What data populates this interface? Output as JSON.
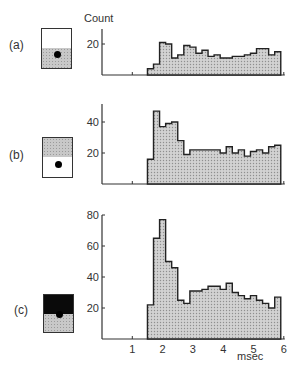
{
  "figure": {
    "y_axis_title": "Count",
    "x_axis_title": "msec",
    "panels": [
      {
        "label": "(a)",
        "inset": "lower half shaded, dot in shaded region"
      },
      {
        "label": "(b)",
        "inset": "upper half shaded, dot in unshaded lower region"
      },
      {
        "label": "(c)",
        "inset": "upper half black, lower half shaded, dot at boundary"
      }
    ]
  },
  "chart_data": [
    {
      "type": "bar",
      "panel": "(a)",
      "title": "",
      "xlabel": "msec",
      "ylabel": "Count",
      "bin_start": 1.5,
      "bin_width": 0.2,
      "x": [
        1.5,
        1.7,
        1.9,
        2.1,
        2.3,
        2.5,
        2.7,
        2.9,
        3.1,
        3.3,
        3.5,
        3.7,
        3.9,
        4.1,
        4.3,
        4.5,
        4.7,
        4.9,
        5.1,
        5.3,
        5.5,
        5.7
      ],
      "values": [
        4,
        7,
        21,
        20,
        11,
        13,
        19,
        18,
        14,
        16,
        12,
        13,
        11,
        11,
        12,
        12,
        13,
        14,
        17,
        17,
        13,
        15
      ],
      "yticks": [
        20
      ],
      "ylim": [
        0,
        30
      ],
      "xlim": [
        0,
        6
      ],
      "grid": false
    },
    {
      "type": "bar",
      "panel": "(b)",
      "title": "",
      "xlabel": "msec",
      "ylabel": "",
      "bin_start": 1.5,
      "bin_width": 0.2,
      "x": [
        1.5,
        1.7,
        1.9,
        2.1,
        2.3,
        2.5,
        2.7,
        2.9,
        3.1,
        3.3,
        3.5,
        3.7,
        3.9,
        4.1,
        4.3,
        4.5,
        4.7,
        4.9,
        5.1,
        5.3,
        5.5,
        5.7
      ],
      "values": [
        16,
        47,
        37,
        39,
        40,
        28,
        19,
        22,
        22,
        22,
        22,
        22,
        20,
        24,
        20,
        22,
        18,
        21,
        22,
        20,
        24,
        25
      ],
      "yticks": [
        20,
        40
      ],
      "ylim": [
        0,
        52
      ],
      "xlim": [
        0,
        6
      ],
      "grid": false
    },
    {
      "type": "bar",
      "panel": "(c)",
      "title": "",
      "xlabel": "msec",
      "ylabel": "",
      "bin_start": 1.5,
      "bin_width": 0.2,
      "x": [
        1.5,
        1.7,
        1.9,
        2.1,
        2.3,
        2.5,
        2.7,
        2.9,
        3.1,
        3.3,
        3.5,
        3.7,
        3.9,
        4.1,
        4.3,
        4.5,
        4.7,
        4.9,
        5.1,
        5.3,
        5.5,
        5.7
      ],
      "values": [
        22,
        65,
        77,
        50,
        46,
        25,
        23,
        31,
        31,
        32,
        34,
        34,
        32,
        36,
        30,
        28,
        26,
        28,
        25,
        23,
        20,
        27
      ],
      "yticks": [
        20,
        40,
        60,
        80
      ],
      "xticks": [
        1,
        2,
        3,
        4,
        5,
        6
      ],
      "ylim": [
        0,
        80
      ],
      "xlim": [
        0,
        6
      ],
      "grid": false
    }
  ]
}
